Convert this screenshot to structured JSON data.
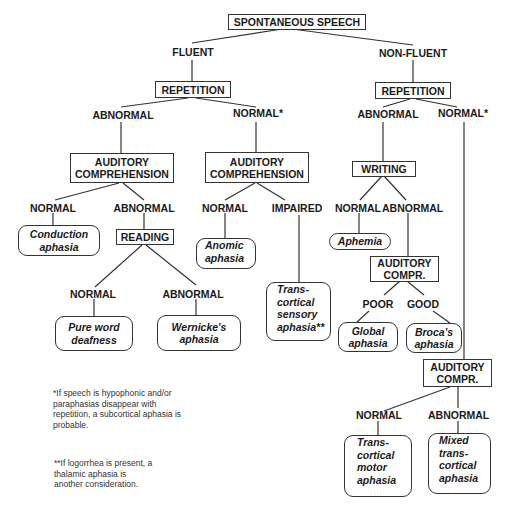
{
  "root": "SPONTANEOUS SPEECH",
  "fluent": {
    "label": "FLUENT",
    "test": "REPETITION",
    "abnormal": {
      "label": "ABNORMAL",
      "test": "AUDITORY COMPREHENSION",
      "normal": {
        "label": "NORMAL",
        "outcome": "Conduction aphasia"
      },
      "abnormal": {
        "label": "ABNORMAL",
        "test": "READING",
        "normal": {
          "label": "NORMAL",
          "outcome": "Pure word deafness"
        },
        "abnormal": {
          "label": "ABNORMAL",
          "outcome": "Wernicke's aphasia"
        }
      }
    },
    "normal": {
      "label": "NORMAL*",
      "test": "AUDITORY COMPREHENSION",
      "normal": {
        "label": "NORMAL",
        "outcome": "Anomic aphasia"
      },
      "impaired": {
        "label": "IMPAIRED",
        "outcome": "Trans-cortical sensory aphasia**"
      }
    }
  },
  "nonfluent": {
    "label": "NON-FLUENT",
    "test": "REPETITION",
    "abnormal": {
      "label": "ABNORMAL",
      "test": "WRITING",
      "normal": {
        "label": "NORMAL",
        "outcome": "Aphemia"
      },
      "abnormal": {
        "label": "ABNORMAL",
        "test": "AUDITORY COMPR.",
        "poor": {
          "label": "POOR",
          "outcome": "Global aphasia"
        },
        "good": {
          "label": "GOOD",
          "outcome": "Broca's aphasia"
        }
      }
    },
    "normal": {
      "label": "NORMAL*",
      "test": "AUDITORY COMPR.",
      "normal": {
        "label": "NORMAL",
        "outcome": "Trans-cortical motor aphasia"
      },
      "abnormal": {
        "label": "ABNORMAL",
        "outcome": "Mixed trans-cortical aphasia"
      }
    }
  },
  "text": {
    "conduction_1": "Conduction",
    "conduction_2": "aphasia",
    "pure_1": "Pure word",
    "pure_2": "deafness",
    "wernicke_1": "Wernicke's",
    "wernicke_2": "aphasia",
    "anomic_1": "Anomic",
    "anomic_2": "aphasia",
    "tcs_1": "Trans-",
    "tcs_2": "cortical",
    "tcs_3": "sensory",
    "tcs_4": "aphasia**",
    "aphemia": "Aphemia",
    "global_1": "Global",
    "global_2": "aphasia",
    "broca_1": "Broca's",
    "broca_2": "aphasia",
    "tcm_1": "Trans-",
    "tcm_2": "cortical",
    "tcm_3": "motor",
    "tcm_4": "aphasia",
    "mixed_1": "Mixed",
    "mixed_2": "trans-",
    "mixed_3": "cortical",
    "mixed_4": "aphasia",
    "aud1_1": "AUDITORY",
    "aud1_2": "COMPREHENSION",
    "aud2_1": "AUDITORY",
    "aud2_2": "COMPREHENSION",
    "aud3_1": "AUDITORY",
    "aud3_2": "COMPR.",
    "aud4_1": "AUDITORY",
    "aud4_2": "COMPR."
  },
  "footnotes": {
    "single_1": "*If speech is hypophonic and/or",
    "single_2": "paraphasias disappear with",
    "single_3": "repetition, a subcortical aphasia is",
    "single_4": "probable.",
    "double_1": "**If logorrhea is present, a",
    "double_2": "thalamic aphasia is",
    "double_3": "another consideration."
  }
}
